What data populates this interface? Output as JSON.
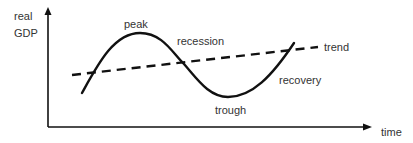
{
  "diagram": {
    "y_axis_label_line1": "real",
    "y_axis_label_line2": "GDP",
    "x_axis_label": "time",
    "labels": {
      "peak": "peak",
      "recession": "recession",
      "trend": "trend",
      "recovery": "recovery",
      "trough": "trough"
    },
    "colors": {
      "line": "#111111",
      "text": "#333333",
      "background": "#ffffff"
    },
    "curve_points": [
      [
        82,
        93
      ],
      [
        140,
        33
      ],
      [
        183,
        63
      ],
      [
        228,
        97
      ],
      [
        294,
        43
      ]
    ],
    "trend_line": {
      "start": [
        72,
        75
      ],
      "end": [
        318,
        47
      ],
      "style": "dashed"
    }
  }
}
